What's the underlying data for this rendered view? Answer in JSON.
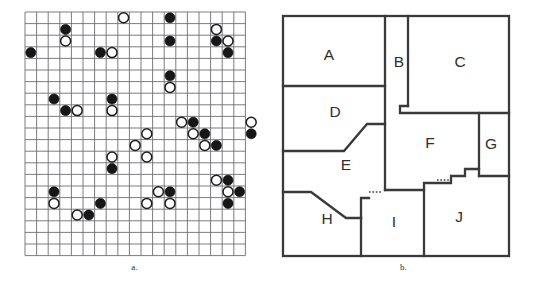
{
  "figure": {
    "panels": [
      {
        "id": "a",
        "caption": "a.",
        "kind": "stone-grid"
      },
      {
        "id": "b",
        "caption": "b.",
        "kind": "floor-plan"
      }
    ]
  },
  "panel_a": {
    "caption": "a.",
    "grid": {
      "columns": 19,
      "rows": 21,
      "cell_size": 11.6,
      "origin_x": 25,
      "origin_y": 12,
      "line_color": "#6e6e73"
    },
    "stone_colors": {
      "black": "#171717",
      "white": "#ffffff",
      "outline": "#1c1c1c"
    },
    "stone_radius": 5.0,
    "stones": [
      {
        "col": 8,
        "row": 0,
        "color": "white"
      },
      {
        "col": 12,
        "row": 0,
        "color": "black"
      },
      {
        "col": 3,
        "row": 1,
        "color": "black"
      },
      {
        "col": 16,
        "row": 1,
        "color": "white"
      },
      {
        "col": 3,
        "row": 2,
        "color": "white"
      },
      {
        "col": 12,
        "row": 2,
        "color": "black"
      },
      {
        "col": 16,
        "row": 2,
        "color": "black"
      },
      {
        "col": 17,
        "row": 2,
        "color": "white"
      },
      {
        "col": 0,
        "row": 3,
        "color": "black"
      },
      {
        "col": 6,
        "row": 3,
        "color": "black"
      },
      {
        "col": 7,
        "row": 3,
        "color": "white"
      },
      {
        "col": 17,
        "row": 3,
        "color": "black"
      },
      {
        "col": 12,
        "row": 5,
        "color": "black"
      },
      {
        "col": 12,
        "row": 6,
        "color": "white"
      },
      {
        "col": 2,
        "row": 7,
        "color": "black"
      },
      {
        "col": 7,
        "row": 7,
        "color": "black"
      },
      {
        "col": 3,
        "row": 8,
        "color": "black"
      },
      {
        "col": 4,
        "row": 8,
        "color": "white"
      },
      {
        "col": 7,
        "row": 8,
        "color": "white"
      },
      {
        "col": 13,
        "row": 9,
        "color": "white"
      },
      {
        "col": 14,
        "row": 9,
        "color": "black"
      },
      {
        "col": 19,
        "row": 9,
        "color": "white"
      },
      {
        "col": 10,
        "row": 10,
        "color": "white"
      },
      {
        "col": 14,
        "row": 10,
        "color": "white"
      },
      {
        "col": 15,
        "row": 10,
        "color": "black"
      },
      {
        "col": 19,
        "row": 10,
        "color": "black"
      },
      {
        "col": 9,
        "row": 11,
        "color": "white"
      },
      {
        "col": 15,
        "row": 11,
        "color": "white"
      },
      {
        "col": 16,
        "row": 11,
        "color": "black"
      },
      {
        "col": 7,
        "row": 12,
        "color": "white"
      },
      {
        "col": 10,
        "row": 12,
        "color": "white"
      },
      {
        "col": 7,
        "row": 13,
        "color": "black"
      },
      {
        "col": 16,
        "row": 14,
        "color": "white"
      },
      {
        "col": 17,
        "row": 14,
        "color": "black"
      },
      {
        "col": 2,
        "row": 15,
        "color": "black"
      },
      {
        "col": 11,
        "row": 15,
        "color": "white"
      },
      {
        "col": 12,
        "row": 15,
        "color": "black"
      },
      {
        "col": 17,
        "row": 15,
        "color": "white"
      },
      {
        "col": 18,
        "row": 15,
        "color": "black"
      },
      {
        "col": 2,
        "row": 16,
        "color": "white"
      },
      {
        "col": 6,
        "row": 16,
        "color": "black"
      },
      {
        "col": 10,
        "row": 16,
        "color": "white"
      },
      {
        "col": 12,
        "row": 16,
        "color": "white"
      },
      {
        "col": 17,
        "row": 16,
        "color": "black"
      },
      {
        "col": 4,
        "row": 17,
        "color": "white"
      },
      {
        "col": 5,
        "row": 17,
        "color": "black"
      }
    ]
  },
  "panel_b": {
    "caption": "b.",
    "outer_rect": {
      "x": 14,
      "y": 16,
      "width": 226,
      "height": 240
    },
    "wall_color": "#3a3a3a",
    "label_color": "#2e2e2e",
    "rooms": [
      {
        "id": "A",
        "label": "A",
        "cx": 60,
        "cy": 56
      },
      {
        "id": "B",
        "label": "B",
        "cx": 130,
        "cy": 63
      },
      {
        "id": "C",
        "label": "C",
        "cx": 191,
        "cy": 63
      },
      {
        "id": "D",
        "label": "D",
        "cx": 66,
        "cy": 113
      },
      {
        "id": "E",
        "label": "E",
        "cx": 77,
        "cy": 166
      },
      {
        "id": "F",
        "label": "F",
        "cx": 161,
        "cy": 144
      },
      {
        "id": "G",
        "label": "G",
        "cx": 222,
        "cy": 145
      },
      {
        "id": "H",
        "label": "H",
        "cx": 58,
        "cy": 220
      },
      {
        "id": "I",
        "label": "I",
        "cx": 125,
        "cy": 223
      },
      {
        "id": "J",
        "label": "J",
        "cx": 190,
        "cy": 218
      }
    ],
    "walls": [
      {
        "name": "a-d-divider",
        "points": "14,86 116,86"
      },
      {
        "name": "a-b-divider",
        "points": "116,16 116,190"
      },
      {
        "name": "b-c-divider",
        "points": "139,16 139,106"
      },
      {
        "name": "c-f-divider",
        "points": "139,106 131,106 131,113 240,113"
      },
      {
        "name": "f-g-divider",
        "points": "210,113 210,176"
      },
      {
        "name": "g-bottom",
        "points": "210,176 240,176"
      },
      {
        "name": "d-e-diagonal",
        "points": "14,151 75,151 98,124 116,124"
      },
      {
        "name": "e-h-diagonal",
        "points": "14,192 42,192 77,218 92,218"
      },
      {
        "name": "e-i-step",
        "points": "92,218 92,198 100,198"
      },
      {
        "name": "i-left-wall",
        "points": "92,218 92,256"
      },
      {
        "name": "e-f-bottom",
        "points": "116,190 155,190 155,183 182,183 182,176 196,176 196,169 210,169"
      },
      {
        "name": "i-j-divider",
        "points": "155,190 155,256"
      }
    ],
    "doors": [
      {
        "name": "door-e-i",
        "points": "100,192 112,192"
      },
      {
        "name": "door-f-j",
        "points": "168,180 182,180"
      }
    ]
  }
}
